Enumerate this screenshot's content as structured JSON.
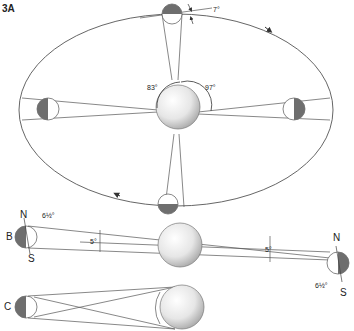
{
  "figure": {
    "panel_label": "3A",
    "top": {
      "angle_top": "7°",
      "angle_left": "83°",
      "angle_right": "97°"
    },
    "row_b": {
      "label": "B",
      "north": "N",
      "south": "S",
      "tilt_left": "6½°",
      "center_angle_left": "5°",
      "center_angle_right": "5°",
      "north_right": "N",
      "south_right": "S",
      "tilt_right": "6½°"
    },
    "row_c": {
      "label": "C"
    },
    "colors": {
      "line": "#555555",
      "shadow": "#6e6e6e",
      "sphere_light": "#ffffff",
      "sphere_dark": "#b0b0b0"
    }
  }
}
